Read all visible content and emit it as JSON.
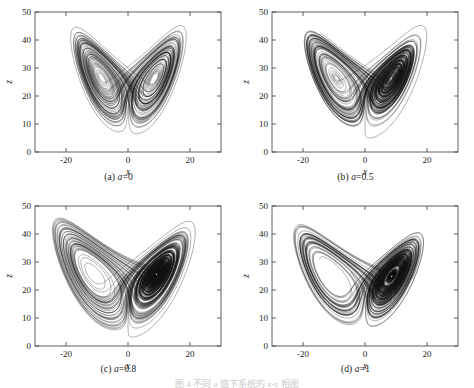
{
  "figure": {
    "caption": "图 4 不同 a 值下系统的 x-z 相图",
    "panel_count": 4
  },
  "axes": {
    "xlabel": "x",
    "ylabel": "z",
    "xticks": [
      "-20",
      "0",
      "20"
    ],
    "xtick_values": [
      -20,
      0,
      20
    ],
    "yticks": [
      "0",
      "10",
      "20",
      "30",
      "40",
      "50"
    ],
    "ytick_values": [
      0,
      10,
      20,
      30,
      40,
      50
    ],
    "xlim": [
      -30,
      30
    ],
    "ylim": [
      0,
      50
    ],
    "grid": false,
    "box": true,
    "line_color": "#111111"
  },
  "chart_data": [
    {
      "type": "line",
      "name": "panel-a",
      "title": "(a) a=0",
      "param_label": "a",
      "param_value": "0",
      "xlabel": "x",
      "ylabel": "z",
      "xlim": [
        -30,
        30
      ],
      "ylim": [
        0,
        50
      ],
      "xticks": [
        -20,
        0,
        20
      ],
      "yticks": [
        0,
        10,
        20,
        30,
        40,
        50
      ],
      "grid": false,
      "description": "Lorenz-type double-scroll butterfly attractor, x-z projection; two lobes centred near (-9,26) and (9,26); wing tips reach z≈45 at |x|≈17; lower cusp near (0,4); trajectory density highest in lobe cores near z≈26",
      "lobe_centers": [
        [
          -9,
          26
        ],
        [
          9,
          26
        ]
      ],
      "z_max_reached": 45,
      "z_min_reached": 4,
      "x_extent_reached": [
        -20,
        20
      ],
      "loop_count": 34,
      "series": [
        {
          "name": "trajectory",
          "values": []
        }
      ]
    },
    {
      "type": "line",
      "name": "panel-b",
      "title": "(b) a=0.5",
      "param_label": "a",
      "param_value": "0.5",
      "xlabel": "x",
      "ylabel": "z",
      "xlim": [
        -30,
        30
      ],
      "ylim": [
        0,
        50
      ],
      "xticks": [
        -20,
        0,
        20
      ],
      "yticks": [
        0,
        10,
        20,
        30,
        40,
        50
      ],
      "grid": false,
      "description": "Denser butterfly attractor with pronounced cross-hatched mixing band between z≈28 and z≈38; lobes centred near (-9,25) and (9,25); outer envelope reaches z≈42 at |x|≈18; bottom cusp near (0,11)",
      "lobe_centers": [
        [
          -9,
          25
        ],
        [
          9,
          25
        ]
      ],
      "z_max_reached": 42,
      "z_min_reached": 11,
      "x_extent_reached": [
        -21,
        21
      ],
      "loop_count": 40,
      "series": [
        {
          "name": "trajectory",
          "values": []
        }
      ]
    },
    {
      "type": "line",
      "name": "panel-c",
      "title": "(c) a=0.8",
      "param_label": "a",
      "param_value": "0.8",
      "xlabel": "x",
      "ylabel": "z",
      "xlim": [
        -30,
        30
      ],
      "ylim": [
        0,
        50
      ],
      "xticks": [
        -20,
        0,
        20
      ],
      "yticks": [
        0,
        10,
        20,
        30,
        40,
        50
      ],
      "grid": false,
      "description": "Broadest attractor; wide outer loops out to |x|≈26 and up to z≈47; heavy straight-segment cross-hatching across the upper centre from z≈27 to z≈45; lobes centred near (-10,24) and (10,24); lower cusp near (0,6)",
      "lobe_centers": [
        [
          -10,
          24
        ],
        [
          10,
          24
        ]
      ],
      "z_max_reached": 47,
      "z_min_reached": 6,
      "x_extent_reached": [
        -26,
        26
      ],
      "loop_count": 44,
      "series": [
        {
          "name": "trajectory",
          "values": []
        }
      ]
    },
    {
      "type": "line",
      "name": "panel-d",
      "title": "(d) a=1",
      "param_label": "a",
      "param_value": "1",
      "xlabel": "x",
      "ylabel": "z",
      "xlim": [
        -30,
        30
      ],
      "ylim": [
        0,
        50
      ],
      "xticks": [
        -20,
        0,
        20
      ],
      "yticks": [
        0,
        10,
        20,
        30,
        40,
        50
      ],
      "grid": false,
      "description": "Similar to panel c with slightly tighter envelope; outer loops to |x|≈25 and z≈45; dense horizontal striation band between z≈30 and z≈40; lobes centred near (-10,24) and (10,24); lower cusp near (0,7)",
      "lobe_centers": [
        [
          -10,
          24
        ],
        [
          10,
          24
        ]
      ],
      "z_max_reached": 45,
      "z_min_reached": 7,
      "x_extent_reached": [
        -25,
        25
      ],
      "loop_count": 42,
      "series": [
        {
          "name": "trajectory",
          "values": []
        }
      ]
    }
  ],
  "panels": [
    {
      "id": "a",
      "caption_prefix": "(a) ",
      "caption_param": "a",
      "caption_value": "=0"
    },
    {
      "id": "b",
      "caption_prefix": "(b) ",
      "caption_param": "a",
      "caption_value": "=0.5"
    },
    {
      "id": "c",
      "caption_prefix": "(c) ",
      "caption_param": "a",
      "caption_value": "=0.8"
    },
    {
      "id": "d",
      "caption_prefix": "(d) ",
      "caption_param": "a",
      "caption_value": "=1"
    }
  ]
}
